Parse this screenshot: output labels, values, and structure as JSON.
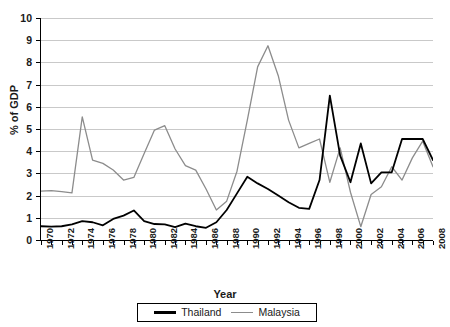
{
  "chart_data": {
    "type": "line",
    "title": "",
    "xlabel": "Year",
    "ylabel": "% of GDP",
    "xlim": [
      1970,
      2008
    ],
    "ylim": [
      0,
      10
    ],
    "ytick_step": 1,
    "xtick_step": 2,
    "grid": "horizontal",
    "legend_position": "bottom-center",
    "x": [
      1970,
      1971,
      1972,
      1973,
      1974,
      1975,
      1976,
      1977,
      1978,
      1979,
      1980,
      1981,
      1982,
      1983,
      1984,
      1985,
      1986,
      1987,
      1988,
      1989,
      1990,
      1991,
      1992,
      1993,
      1994,
      1995,
      1996,
      1997,
      1998,
      1999,
      2000,
      2001,
      2002,
      2003,
      2004,
      2005,
      2006,
      2007,
      2008
    ],
    "ytick_labels": [
      "0",
      "1",
      "2",
      "3",
      "4",
      "5",
      "6",
      "7",
      "8",
      "9",
      "10"
    ],
    "xtick_labels": [
      "1970",
      "1972",
      "1974",
      "1976",
      "1978",
      "1980",
      "1982",
      "1984",
      "1986",
      "1988",
      "1990",
      "1992",
      "1994",
      "1996",
      "1998",
      "2000",
      "2002",
      "2004",
      "2006",
      "2008"
    ],
    "series": [
      {
        "name": "Thailand",
        "color": "#000000",
        "width": 1.8,
        "values": [
          0.62,
          0.6,
          0.62,
          0.7,
          0.85,
          0.8,
          0.66,
          0.95,
          1.1,
          1.33,
          0.85,
          0.72,
          0.7,
          0.58,
          0.74,
          0.62,
          0.55,
          0.8,
          1.35,
          2.1,
          2.85,
          2.55,
          2.3,
          2.0,
          1.7,
          1.45,
          1.4,
          2.7,
          6.5,
          3.8,
          2.6,
          4.35,
          2.55,
          3.05,
          3.05,
          4.55,
          4.55,
          4.55,
          3.6
        ]
      },
      {
        "name": "Malaysia",
        "color": "#8c8c8c",
        "width": 1.3,
        "values": [
          2.2,
          2.22,
          2.18,
          2.12,
          5.55,
          3.6,
          3.45,
          3.15,
          2.7,
          2.82,
          3.9,
          4.95,
          5.15,
          4.1,
          3.35,
          3.15,
          2.3,
          1.35,
          1.75,
          3.1,
          5.4,
          7.8,
          8.75,
          7.4,
          5.4,
          4.15,
          4.35,
          4.55,
          2.6,
          4.15,
          2.15,
          0.6,
          2.05,
          2.4,
          3.3,
          2.7,
          3.7,
          4.45,
          3.3
        ]
      }
    ]
  },
  "legend": {
    "items": [
      {
        "label": "Thailand"
      },
      {
        "label": "Malaysia"
      }
    ]
  },
  "axes": {
    "y_title": "% of GDP",
    "x_title": "Year"
  }
}
